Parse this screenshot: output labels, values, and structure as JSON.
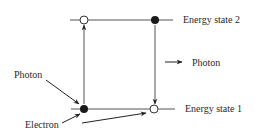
{
  "diagram": {
    "type": "energy-level-transition",
    "levels": [
      {
        "id": "state2",
        "label": "Energy state 2",
        "y": 20
      },
      {
        "id": "state1",
        "label": "Energy state 1",
        "y": 109
      }
    ],
    "labels": {
      "energy_state_2": "Energy state 2",
      "energy_state_1": "Energy state 1",
      "photon_emitted": "Photon",
      "photon_absorbed": "Photon",
      "electron": "Electron"
    },
    "transitions": [
      {
        "direction": "up",
        "from": "state1",
        "to": "state2",
        "cause": "photon absorbed"
      },
      {
        "direction": "down",
        "from": "state2",
        "to": "state1",
        "result": "photon emitted"
      }
    ],
    "colors": {
      "line": "#555555",
      "ink": "#222222",
      "text": "#2a2a2a",
      "background": "#ffffff"
    }
  }
}
